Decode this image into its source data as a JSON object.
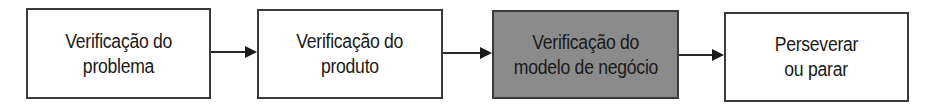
{
  "diagram": {
    "type": "flowchart",
    "direction": "left-to-right",
    "nodes": [
      {
        "id": "n1",
        "lines": [
          "Verificação do",
          "problema"
        ],
        "highlighted": false
      },
      {
        "id": "n2",
        "lines": [
          "Verificação do",
          "produto"
        ],
        "highlighted": false
      },
      {
        "id": "n3",
        "lines": [
          "Verificação do",
          "modelo de negócio"
        ],
        "highlighted": true
      },
      {
        "id": "n4",
        "lines": [
          "Perseverar",
          "ou parar"
        ],
        "highlighted": false
      }
    ],
    "edges": [
      {
        "from": "n1",
        "to": "n2"
      },
      {
        "from": "n2",
        "to": "n3"
      },
      {
        "from": "n3",
        "to": "n4"
      }
    ],
    "colors": {
      "border": "#3a3a3a",
      "highlight_fill": "#8b8b8b",
      "default_fill": "#ffffff",
      "text": "#1a1a1a"
    }
  }
}
